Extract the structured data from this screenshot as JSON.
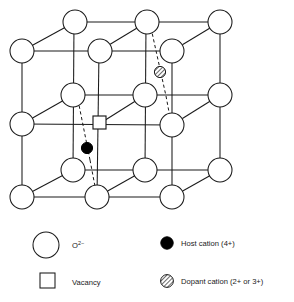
{
  "figure": {
    "colors": {
      "line": "#1a1a1a",
      "node_fill": "#ffffff",
      "host_cation_fill": "#000000",
      "dopant_hatch": "#555555",
      "vacancy_fill": "#ffffff",
      "text": "#1a1a1a"
    },
    "lattice": {
      "anion_label": "O2-",
      "anion_count": 18,
      "nodes": [
        {
          "id": "b-tl",
          "x": 75,
          "y": 22,
          "layer": "back",
          "r": 12
        },
        {
          "id": "b-tm",
          "x": 147,
          "y": 22,
          "layer": "back",
          "r": 12
        },
        {
          "id": "b-tr",
          "x": 220,
          "y": 22,
          "layer": "back",
          "r": 12
        },
        {
          "id": "f-tl",
          "x": 22,
          "y": 51,
          "layer": "front",
          "r": 12
        },
        {
          "id": "m-tm",
          "x": 100,
          "y": 51,
          "layer": "mid",
          "r": 12
        },
        {
          "id": "f-tr",
          "x": 172,
          "y": 51,
          "layer": "front",
          "r": 12
        },
        {
          "id": "b-ml",
          "x": 73,
          "y": 95,
          "layer": "back",
          "r": 12
        },
        {
          "id": "b-mm",
          "x": 145,
          "y": 95,
          "layer": "back",
          "r": 12
        },
        {
          "id": "b-mr",
          "x": 220,
          "y": 95,
          "layer": "back",
          "r": 12
        },
        {
          "id": "f-ml",
          "x": 22,
          "y": 124,
          "layer": "front",
          "r": 12
        },
        {
          "id": "f-mr",
          "x": 172,
          "y": 125,
          "layer": "front",
          "r": 12
        },
        {
          "id": "b-bl",
          "x": 73,
          "y": 170,
          "layer": "back",
          "r": 12
        },
        {
          "id": "b-bm",
          "x": 145,
          "y": 170,
          "layer": "back",
          "r": 12
        },
        {
          "id": "b-br",
          "x": 220,
          "y": 170,
          "layer": "back",
          "r": 12
        },
        {
          "id": "f-bl",
          "x": 22,
          "y": 197,
          "layer": "front",
          "r": 12
        },
        {
          "id": "f-bm",
          "x": 97,
          "y": 197,
          "layer": "front",
          "r": 12
        },
        {
          "id": "f-br",
          "x": 172,
          "y": 197,
          "layer": "front",
          "r": 12
        },
        {
          "id": "m-bm",
          "x": 97,
          "y": 124,
          "layer": "mid",
          "r": 0
        }
      ],
      "defects": [
        {
          "type": "vacancy",
          "x": 99,
          "y": 122,
          "size": 12
        },
        {
          "type": "host-cation",
          "x": 87,
          "y": 148,
          "r": 5.5
        },
        {
          "type": "dopant-cation",
          "x": 160,
          "y": 72,
          "r": 5.5
        }
      ]
    },
    "legend": {
      "items": [
        {
          "key": "anion",
          "symbol": "open-circle",
          "label": "O",
          "sup": "2−",
          "col": "left",
          "row": 1
        },
        {
          "key": "host",
          "symbol": "filled-circle",
          "label": "Host cation (4+)",
          "sup": "",
          "col": "right",
          "row": 1
        },
        {
          "key": "vacancy",
          "symbol": "open-square",
          "label": "Vacancy",
          "sup": "",
          "col": "left",
          "row": 2
        },
        {
          "key": "dopant",
          "symbol": "hatched-circle",
          "label": "Dopant cation (2+ or 3+)",
          "sup": "",
          "col": "right",
          "row": 2
        }
      ]
    }
  }
}
